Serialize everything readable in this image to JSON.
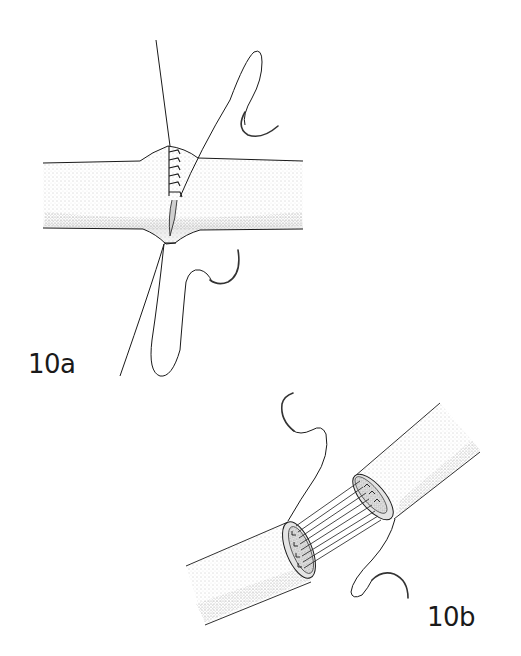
{
  "figure": {
    "panels": [
      {
        "id": "10a",
        "label": "10a",
        "description": "End-to-end vessel anastomosis with running suture partially completed; two suture threads with curved needles"
      },
      {
        "id": "10b",
        "label": "10b",
        "description": "Two vessel ends approximated with parallel stay sutures placed across the gap before tying; curved needles on each thread end"
      }
    ]
  },
  "colors": {
    "ink": "#1a1a1a",
    "stipple": "#9a9a9a",
    "background": "#ffffff"
  }
}
